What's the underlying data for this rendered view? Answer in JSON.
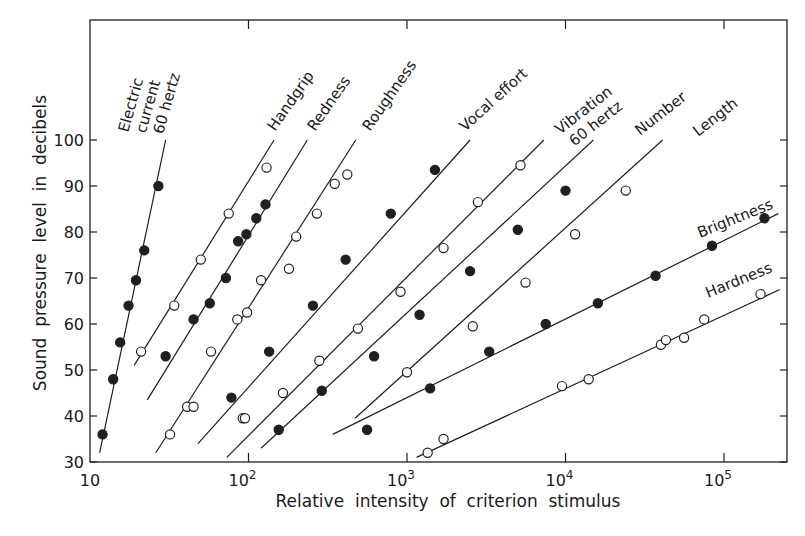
{
  "chart_data": {
    "type": "scatter",
    "title": "",
    "xlabel": "Relative  intensity  of  criterion  stimulus",
    "ylabel": "Sound  pressure  level  in  decibels",
    "xscale": "log",
    "xlim": [
      10,
      230000
    ],
    "ylim": [
      30,
      110
    ],
    "grid": false,
    "legend": "inline labels at upper end of each line",
    "x_ticks": [
      {
        "value": 10,
        "label": "10"
      },
      {
        "value": 100,
        "label": "10",
        "sup": "2"
      },
      {
        "value": 1000,
        "label": "10",
        "sup": "3"
      },
      {
        "value": 10000,
        "label": "10",
        "sup": "4"
      },
      {
        "value": 100000,
        "label": "10",
        "sup": "5"
      }
    ],
    "y_ticks": [
      30,
      40,
      50,
      60,
      70,
      80,
      90,
      100
    ],
    "series": [
      {
        "name": "Electric current 60 hertz",
        "label_lines": [
          "Electric",
          "current",
          "60 hertz"
        ],
        "marker": "filled",
        "line": {
          "x": [
            11.5,
            30
          ],
          "y": [
            32,
            100
          ]
        },
        "points": [
          {
            "x": 12,
            "y": 36
          },
          {
            "x": 14,
            "y": 48
          },
          {
            "x": 15.5,
            "y": 56
          },
          {
            "x": 17.5,
            "y": 64
          },
          {
            "x": 19.5,
            "y": 69.5
          },
          {
            "x": 22,
            "y": 76
          },
          {
            "x": 27,
            "y": 90
          }
        ]
      },
      {
        "name": "Handgrip",
        "label_lines": [
          "Handgrip"
        ],
        "marker": "open",
        "line": {
          "x": [
            19,
            145
          ],
          "y": [
            51,
            100
          ]
        },
        "points": [
          {
            "x": 21,
            "y": 54
          },
          {
            "x": 34,
            "y": 64
          },
          {
            "x": 50,
            "y": 74
          },
          {
            "x": 75,
            "y": 84
          },
          {
            "x": 130,
            "y": 94
          }
        ]
      },
      {
        "name": "Redness",
        "label_lines": [
          "Redness"
        ],
        "marker": "filled",
        "line": {
          "x": [
            23,
            235
          ],
          "y": [
            43.5,
            100
          ]
        },
        "points": [
          {
            "x": 30,
            "y": 53
          },
          {
            "x": 45,
            "y": 61
          },
          {
            "x": 57,
            "y": 64.5
          },
          {
            "x": 72,
            "y": 70
          },
          {
            "x": 86,
            "y": 78
          },
          {
            "x": 97,
            "y": 79.5
          },
          {
            "x": 112,
            "y": 83
          },
          {
            "x": 128,
            "y": 86
          }
        ]
      },
      {
        "name": "Roughness",
        "label_lines": [
          "Roughness"
        ],
        "marker": "open",
        "line": {
          "x": [
            26,
            475
          ],
          "y": [
            32,
            100
          ]
        },
        "points": [
          {
            "x": 32,
            "y": 36
          },
          {
            "x": 41,
            "y": 42
          },
          {
            "x": 45,
            "y": 42
          },
          {
            "x": 58,
            "y": 54
          },
          {
            "x": 85,
            "y": 61
          },
          {
            "x": 98,
            "y": 62.5
          },
          {
            "x": 120,
            "y": 69.5
          },
          {
            "x": 180,
            "y": 72
          },
          {
            "x": 200,
            "y": 79
          },
          {
            "x": 270,
            "y": 84
          },
          {
            "x": 350,
            "y": 90.5
          },
          {
            "x": 420,
            "y": 92.5
          },
          {
            "x": 92,
            "y": 39.5
          }
        ]
      },
      {
        "name": "Vocal effort",
        "label_lines": [
          "Vocal  effort"
        ],
        "marker": "filled",
        "line": {
          "x": [
            48,
            2500
          ],
          "y": [
            34,
            100
          ]
        },
        "points": [
          {
            "x": 78,
            "y": 44
          },
          {
            "x": 135,
            "y": 54
          },
          {
            "x": 155,
            "y": 37
          },
          {
            "x": 255,
            "y": 64
          },
          {
            "x": 410,
            "y": 74
          },
          {
            "x": 790,
            "y": 84
          },
          {
            "x": 1500,
            "y": 93.5
          }
        ]
      },
      {
        "name": "Vibration 60 hertz",
        "label_lines": [
          "Vibration",
          "60 hertz"
        ],
        "marker": "open",
        "line": {
          "x": [
            73,
            7300
          ],
          "y": [
            31,
            100
          ]
        },
        "points": [
          {
            "x": 165,
            "y": 45
          },
          {
            "x": 280,
            "y": 52
          },
          {
            "x": 490,
            "y": 59
          },
          {
            "x": 910,
            "y": 67
          },
          {
            "x": 1700,
            "y": 76.5
          },
          {
            "x": 2800,
            "y": 86.5
          },
          {
            "x": 5200,
            "y": 94.5
          },
          {
            "x": 95,
            "y": 39.5
          }
        ]
      },
      {
        "name": "Number",
        "label_lines": [
          "Number"
        ],
        "marker": "filled",
        "line": {
          "x": [
            120,
            15000
          ],
          "y": [
            33,
            100
          ]
        },
        "points": [
          {
            "x": 290,
            "y": 45.5
          },
          {
            "x": 620,
            "y": 53
          },
          {
            "x": 1200,
            "y": 62
          },
          {
            "x": 2500,
            "y": 71.5
          },
          {
            "x": 5000,
            "y": 80.5
          },
          {
            "x": 10000,
            "y": 89
          }
        ]
      },
      {
        "name": "Length",
        "label_lines": [
          "Length"
        ],
        "marker": "open",
        "line": {
          "x": [
            470,
            41000
          ],
          "y": [
            39.5,
            100
          ]
        },
        "points": [
          {
            "x": 1000,
            "y": 49.5
          },
          {
            "x": 2600,
            "y": 59.5
          },
          {
            "x": 5600,
            "y": 69
          },
          {
            "x": 11500,
            "y": 79.5
          },
          {
            "x": 24000,
            "y": 89
          }
        ]
      },
      {
        "name": "Brightness",
        "label_lines": [
          "Brightness"
        ],
        "marker": "filled",
        "line": {
          "x": [
            340,
            220000
          ],
          "y": [
            36,
            84
          ]
        },
        "points": [
          {
            "x": 560,
            "y": 37
          },
          {
            "x": 1400,
            "y": 46
          },
          {
            "x": 3300,
            "y": 54
          },
          {
            "x": 7500,
            "y": 60
          },
          {
            "x": 16000,
            "y": 64.5
          },
          {
            "x": 37000,
            "y": 70.5
          },
          {
            "x": 84000,
            "y": 77
          },
          {
            "x": 180000,
            "y": 83
          }
        ]
      },
      {
        "name": "Hardness",
        "label_lines": [
          "Hardness"
        ],
        "marker": "open",
        "line": {
          "x": [
            1150,
            225000
          ],
          "y": [
            31,
            67.5
          ]
        },
        "points": [
          {
            "x": 1350,
            "y": 32
          },
          {
            "x": 1700,
            "y": 35
          },
          {
            "x": 9500,
            "y": 46.5
          },
          {
            "x": 14000,
            "y": 48
          },
          {
            "x": 40000,
            "y": 55.5
          },
          {
            "x": 43000,
            "y": 56.5
          },
          {
            "x": 56000,
            "y": 57
          },
          {
            "x": 75000,
            "y": 61
          },
          {
            "x": 170000,
            "y": 66.5
          }
        ]
      }
    ]
  }
}
